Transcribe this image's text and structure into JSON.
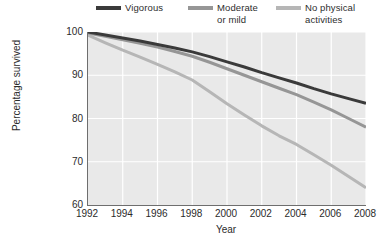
{
  "chart_data": {
    "type": "line",
    "title": "",
    "xlabel": "Year",
    "ylabel": "Percentage survived",
    "xlim": [
      1992,
      2008
    ],
    "ylim": [
      60,
      100
    ],
    "grid": true,
    "legend_position": "top",
    "x_ticks": [
      "1992",
      "1994",
      "1996",
      "1998",
      "2000",
      "2002",
      "2004",
      "2006",
      "2008"
    ],
    "y_ticks": [
      "60",
      "70",
      "80",
      "90",
      "100"
    ],
    "x": [
      1992,
      1993,
      1994,
      1995,
      1996,
      1997,
      1998,
      1999,
      2000,
      2001,
      2002,
      2003,
      2004,
      2005,
      2006,
      2007,
      2008
    ],
    "series": [
      {
        "name": "Vigorous",
        "color": "#3a3a3a",
        "values": [
          100.0,
          99.3,
          98.6,
          97.9,
          97.1,
          96.3,
          95.4,
          94.3,
          93.1,
          91.9,
          90.6,
          89.4,
          88.2,
          86.9,
          85.7,
          84.6,
          83.5
        ]
      },
      {
        "name": "Moderate or mild",
        "color": "#969696",
        "values": [
          99.8,
          99.0,
          98.2,
          97.4,
          96.5,
          95.5,
          94.4,
          93.0,
          91.5,
          90.0,
          88.5,
          87.0,
          85.5,
          83.8,
          82.0,
          80.0,
          78.0
        ]
      },
      {
        "name": "No physical activities",
        "color": "#b6b6b6",
        "values": [
          99.3,
          97.5,
          95.8,
          94.2,
          92.5,
          90.8,
          88.9,
          86.2,
          83.4,
          80.8,
          78.3,
          76.0,
          74.0,
          71.6,
          69.2,
          66.6,
          64.0
        ]
      }
    ]
  },
  "legend": {
    "entries": [
      {
        "label": "Vigorous",
        "color": "#3a3a3a"
      },
      {
        "label": "Moderate\nor mild",
        "color": "#969696"
      },
      {
        "label": "No physical\nactivities",
        "color": "#b6b6b6"
      }
    ]
  },
  "axes": {
    "y_title": "Percentage survived",
    "x_title": "Year"
  },
  "footer": {
    "partial_text": ""
  }
}
